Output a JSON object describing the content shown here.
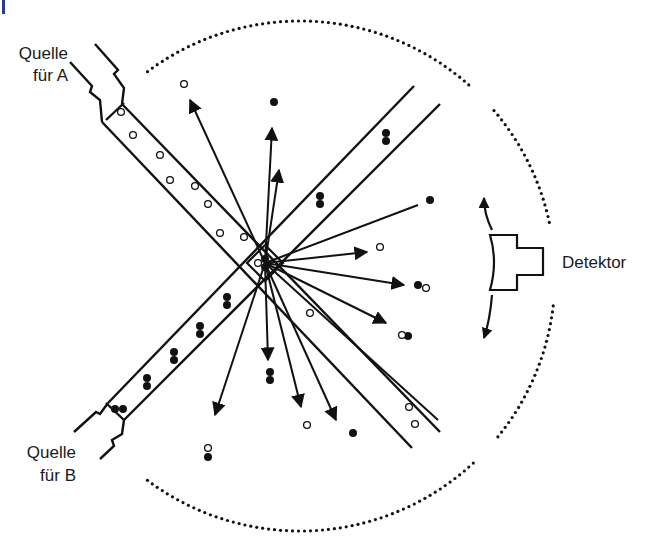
{
  "labels": {
    "source_a": [
      "Quelle",
      "für A"
    ],
    "source_b": [
      "Quelle",
      "für B"
    ],
    "detector": "Detektor"
  },
  "colors": {
    "ink": "#111111",
    "corner_mark": "#2a3a8c",
    "background": "#ffffff"
  },
  "chamber": {
    "cx": 300,
    "cy": 276,
    "r": 255,
    "dot_spacing": 6
  },
  "beam_a": {
    "outer1": [
      [
        100,
        70
      ],
      [
        440,
        430
      ]
    ],
    "outer2": [
      [
        96,
        112
      ],
      [
        410,
        445
      ]
    ],
    "atoms_open": [
      [
        121,
        112
      ],
      [
        133,
        135
      ],
      [
        160,
        155
      ],
      [
        170,
        180
      ],
      [
        195,
        186
      ],
      [
        208,
        204
      ],
      [
        220,
        233
      ],
      [
        244,
        237
      ],
      [
        409,
        407
      ],
      [
        415,
        424
      ]
    ]
  },
  "beam_b": {
    "atoms_filled_pairs": [
      [
        386,
        137
      ],
      [
        320,
        200
      ],
      [
        227,
        301
      ],
      [
        200,
        330
      ],
      [
        174,
        356
      ],
      [
        147,
        382
      ],
      [
        119,
        409
      ]
    ],
    "atoms_open": []
  },
  "collision_center": [
    265,
    263
  ],
  "scattered_arrows": [
    {
      "to": [
        190,
        100
      ],
      "head": true
    },
    {
      "to": [
        272,
        128
      ],
      "head": true
    },
    {
      "to": [
        279,
        170
      ],
      "head": true
    },
    {
      "to": [
        418,
        205
      ],
      "head": false
    },
    {
      "to": [
        367,
        252
      ],
      "head": true
    },
    {
      "to": [
        404,
        285
      ],
      "head": true
    },
    {
      "to": [
        386,
        323
      ],
      "head": true
    },
    {
      "to": [
        268,
        360
      ],
      "head": true
    },
    {
      "to": [
        301,
        407
      ],
      "head": true
    },
    {
      "to": [
        336,
        420
      ],
      "head": true
    },
    {
      "to": [
        215,
        415
      ],
      "head": true
    },
    {
      "to": [
        438,
        420
      ],
      "head": false
    }
  ],
  "scattered_filled": [
    [
      274,
      102
    ],
    [
      430,
      200
    ],
    [
      418,
      285
    ],
    [
      408,
      336
    ],
    [
      353,
      433
    ],
    [
      208,
      457
    ]
  ],
  "scattered_filled_pairs": [
    [
      270,
      376
    ]
  ],
  "scattered_open": [
    [
      184,
      84
    ],
    [
      380,
      247
    ],
    [
      426,
      288
    ],
    [
      402,
      335
    ],
    [
      310,
      313
    ],
    [
      307,
      425
    ],
    [
      208,
      448
    ]
  ]
}
